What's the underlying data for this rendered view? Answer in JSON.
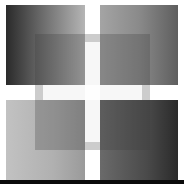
{
  "image": {
    "width": 184,
    "height": 184,
    "background": "#ffffff",
    "description": "Grayscale composition of four gradient squares separated by a white cross, with a larger translucent darker square overlaid across the center",
    "colors": {
      "top_left": [
        "#2a2a2a",
        "#b5b5b5"
      ],
      "top_right": [
        "#a4a4a4",
        "#5e5e5e"
      ],
      "bottom_left": [
        "#c2c2c2",
        "#9a9a9a"
      ],
      "bottom_right": [
        "#6a6a6a",
        "#2a2a2a"
      ],
      "bottom_bar": "#0a0a0a"
    }
  }
}
